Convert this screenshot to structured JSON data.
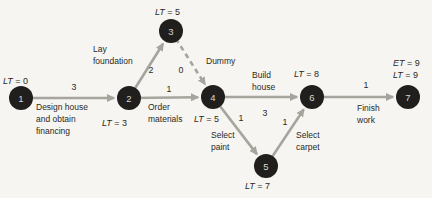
{
  "figure": {
    "background": "#f6f5f1",
    "colors": {
      "node_fill": "#211f1d",
      "node_label": "#d8d6d2",
      "edge": "#a7a49e",
      "text": "#2b2925"
    },
    "node_radius": 12,
    "nodes": [
      {
        "id": "1",
        "x": 21,
        "y": 98
      },
      {
        "id": "2",
        "x": 129,
        "y": 98
      },
      {
        "id": "3",
        "x": 171,
        "y": 31
      },
      {
        "id": "4",
        "x": 213,
        "y": 97
      },
      {
        "id": "5",
        "x": 266,
        "y": 166
      },
      {
        "id": "6",
        "x": 312,
        "y": 97
      },
      {
        "id": "7",
        "x": 408,
        "y": 97
      }
    ],
    "node_annotations": [
      {
        "node": "1",
        "text": "LT = 0",
        "x": 3,
        "y": 84
      },
      {
        "node": "2",
        "text": "LT = 3",
        "x": 102,
        "y": 126
      },
      {
        "node": "3",
        "text": "LT = 5",
        "x": 155,
        "y": 15
      },
      {
        "node": "4",
        "text": "LT = 5",
        "x": 194,
        "y": 122
      },
      {
        "node": "5",
        "text": "LT = 7",
        "x": 245,
        "y": 189
      },
      {
        "node": "6",
        "text": "LT = 8",
        "x": 294,
        "y": 77
      },
      {
        "node": "7",
        "text": "ET = 9",
        "x": 393,
        "y": 66
      },
      {
        "node": "7",
        "text": "LT = 9",
        "x": 393,
        "y": 78
      }
    ],
    "edges": [
      {
        "from": "1",
        "to": "2",
        "style": "solid",
        "duration": "3",
        "duration_pos": [
          74,
          90
        ],
        "activity": [
          "Design house",
          "and obtain",
          "financing"
        ],
        "activity_pos": [
          36,
          110
        ]
      },
      {
        "from": "2",
        "to": "3",
        "style": "solid",
        "duration": "2",
        "duration_pos": [
          151,
          73
        ],
        "activity": [
          "Lay",
          "foundation"
        ],
        "activity_pos": [
          93,
          52
        ]
      },
      {
        "from": "3",
        "to": "4",
        "style": "dashed",
        "duration": "0",
        "duration_pos": [
          181,
          73
        ],
        "activity": [
          "Dummy"
        ],
        "activity_pos": [
          206,
          64
        ]
      },
      {
        "from": "2",
        "to": "4",
        "style": "solid",
        "duration": "1",
        "duration_pos": [
          169,
          92
        ],
        "activity": [
          "Order",
          "materials"
        ],
        "activity_pos": [
          148,
          110
        ]
      },
      {
        "from": "4",
        "to": "6",
        "style": "solid",
        "duration": "3",
        "duration_pos": [
          265,
          116
        ],
        "activity": [
          "Build",
          "house"
        ],
        "activity_pos": [
          252,
          78
        ]
      },
      {
        "from": "4",
        "to": "5",
        "style": "solid",
        "duration": "1",
        "duration_pos": [
          241,
          121
        ],
        "activity": [
          "Select",
          "paint"
        ],
        "activity_pos": [
          211,
          138
        ]
      },
      {
        "from": "5",
        "to": "6",
        "style": "solid",
        "duration": "1",
        "duration_pos": [
          285,
          125
        ],
        "activity": [
          "Select",
          "carpet"
        ],
        "activity_pos": [
          296,
          138
        ]
      },
      {
        "from": "6",
        "to": "7",
        "style": "solid",
        "duration": "1",
        "duration_pos": [
          366,
          88
        ],
        "activity": [
          "Finish",
          "work"
        ],
        "activity_pos": [
          357,
          111
        ]
      }
    ]
  }
}
